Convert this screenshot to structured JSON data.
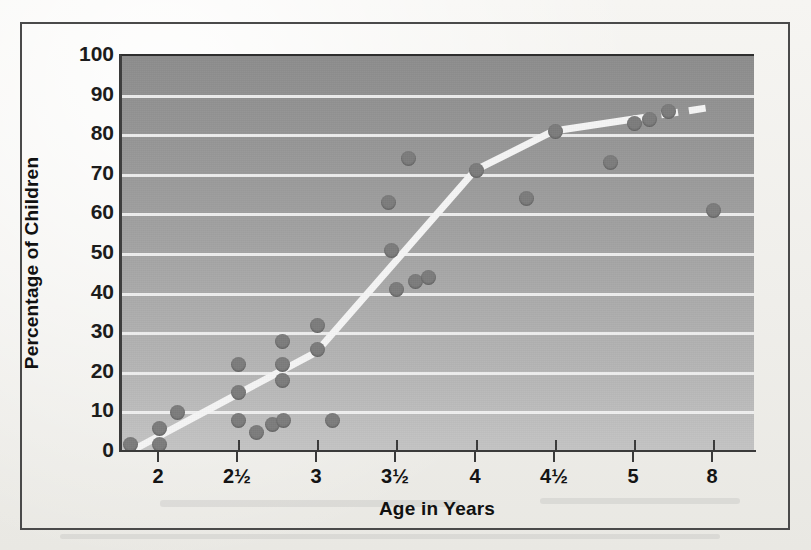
{
  "figure": {
    "background_color": "#f2f1ee",
    "plot_background_top": "#8d8d8d",
    "plot_background_bottom": "#c4c4c4",
    "gridline_color": "#f3f3f3",
    "marker_color": "#7c7c7c",
    "trendline_color": "#f5f5f5",
    "frame_color": "#4a4a4a"
  },
  "chart_data": {
    "type": "scatter",
    "title": "",
    "subtitle": "",
    "xlabel": "Age in Years",
    "ylabel": "Percentage of Children",
    "grid": true,
    "legend": false,
    "legend_position": "none",
    "xtick_labels": [
      "2",
      "2½",
      "3",
      "3½",
      "4",
      "4½",
      "5",
      "8"
    ],
    "xtick_values": [
      2,
      2.5,
      3,
      3.5,
      4,
      4.5,
      5,
      8
    ],
    "ytick_labels": [
      "0",
      "10",
      "20",
      "30",
      "40",
      "50",
      "60",
      "70",
      "80",
      "90",
      "100"
    ],
    "ytick_values": [
      0,
      10,
      20,
      30,
      40,
      50,
      60,
      70,
      80,
      90,
      100
    ],
    "ylim": [
      0,
      100
    ],
    "xlim_note": "ordinal category axis with non-uniform real ages; last tick 8 is compressed",
    "series": [
      {
        "name": "Children (scatter)",
        "marker": "circle",
        "points": [
          {
            "x": 1.82,
            "y": 2
          },
          {
            "x": 2.0,
            "y": 6
          },
          {
            "x": 2.0,
            "y": 2
          },
          {
            "x": 2.12,
            "y": 10
          },
          {
            "x": 2.5,
            "y": 22
          },
          {
            "x": 2.5,
            "y": 15
          },
          {
            "x": 2.5,
            "y": 8
          },
          {
            "x": 2.62,
            "y": 5
          },
          {
            "x": 2.72,
            "y": 7
          },
          {
            "x": 2.78,
            "y": 28
          },
          {
            "x": 2.78,
            "y": 22
          },
          {
            "x": 2.78,
            "y": 18
          },
          {
            "x": 2.79,
            "y": 8
          },
          {
            "x": 3.0,
            "y": 32
          },
          {
            "x": 3.0,
            "y": 26
          },
          {
            "x": 3.1,
            "y": 8
          },
          {
            "x": 3.45,
            "y": 63
          },
          {
            "x": 3.47,
            "y": 51
          },
          {
            "x": 3.5,
            "y": 41
          },
          {
            "x": 3.58,
            "y": 74
          },
          {
            "x": 3.62,
            "y": 43
          },
          {
            "x": 3.7,
            "y": 44
          },
          {
            "x": 4.0,
            "y": 71
          },
          {
            "x": 4.32,
            "y": 64
          },
          {
            "x": 4.5,
            "y": 81
          },
          {
            "x": 4.85,
            "y": 73
          },
          {
            "x": 5.0,
            "y": 83
          },
          {
            "x": 5.6,
            "y": 84
          },
          {
            "x": 6.3,
            "y": 86
          },
          {
            "x": 8.0,
            "y": 61
          }
        ]
      },
      {
        "name": "Trend line",
        "style": "solid-then-dashed",
        "vertices": [
          {
            "x": 1.78,
            "y": -1
          },
          {
            "x": 3.0,
            "y": 25
          },
          {
            "x": 4.0,
            "y": 71
          },
          {
            "x": 4.5,
            "y": 81
          },
          {
            "x": 8.0,
            "y": 87
          }
        ],
        "dash_starts_at_x": 5.05
      }
    ]
  }
}
